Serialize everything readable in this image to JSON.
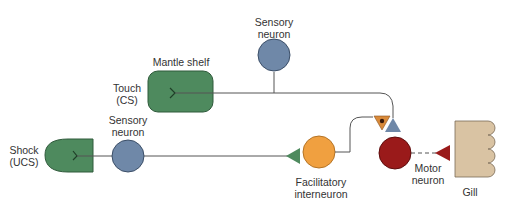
{
  "labels": {
    "sensory_top_1": "Sensory",
    "sensory_top_2": "neuron",
    "mantle_shelf": "Mantle shelf",
    "touch_1": "Touch",
    "touch_2": "(CS)",
    "shock_1": "Shock",
    "shock_2": "(UCS)",
    "sensory_bottom_1": "Sensory",
    "sensory_bottom_2": "neuron",
    "facilitatory_1": "Facilitatory",
    "facilitatory_2": "interneuron",
    "motor_1": "Motor",
    "motor_2": "neuron",
    "gill": "Gill"
  },
  "colors": {
    "receptor_green": "#4e8a5e",
    "sensory_blue": "#6f88a8",
    "interneuron_orange": "#f0a040",
    "motor_red": "#9a1a1a",
    "gill_tan": "#d9c3a3",
    "line": "#555555"
  }
}
